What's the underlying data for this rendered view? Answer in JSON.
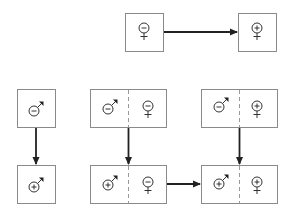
{
  "diagram": {
    "title": "",
    "symbols": {
      "male_minus": {
        "sex": "male",
        "sign": "−"
      },
      "male_plus": {
        "sex": "male",
        "sign": "+"
      },
      "female_minus": {
        "sex": "female",
        "sign": "−"
      },
      "female_plus": {
        "sex": "female",
        "sign": "+"
      }
    },
    "nodes": [
      {
        "id": "top-left",
        "cells": [
          "female_minus"
        ]
      },
      {
        "id": "top-right",
        "cells": [
          "female_plus"
        ]
      },
      {
        "id": "A",
        "cells": [
          "male_minus"
        ]
      },
      {
        "id": "B",
        "cells": [
          "male_plus"
        ]
      },
      {
        "id": "C",
        "cells": [
          "male_minus",
          "female_minus"
        ]
      },
      {
        "id": "D",
        "cells": [
          "male_plus",
          "female_minus"
        ]
      },
      {
        "id": "E",
        "cells": [
          "male_minus",
          "female_plus"
        ]
      },
      {
        "id": "F",
        "cells": [
          "male_plus",
          "female_plus"
        ]
      }
    ],
    "edges": [
      {
        "from": "top-left",
        "to": "top-right"
      },
      {
        "from": "A",
        "to": "B"
      },
      {
        "from": "C",
        "to": "D"
      },
      {
        "from": "E",
        "to": "F"
      },
      {
        "from": "D",
        "to": "F"
      }
    ],
    "colors": {
      "border": "#8a8a8a",
      "arrow": "#222222",
      "symbol": "#333333"
    }
  }
}
